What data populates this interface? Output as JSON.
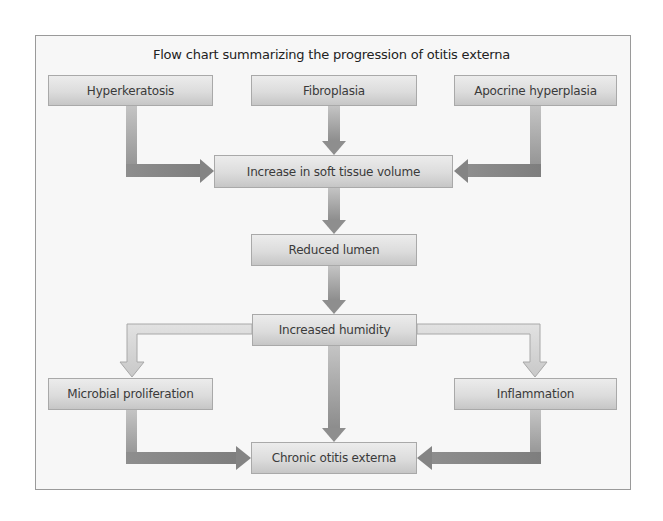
{
  "diagram": {
    "title": "Flow chart summarizing the progression of otitis externa",
    "nodes": {
      "hyperkeratosis": "Hyperkeratosis",
      "fibroplasia": "Fibroplasia",
      "apocrine": "Apocrine hyperplasia",
      "soft_tissue": "Increase in soft tissue volume",
      "reduced_lumen": "Reduced lumen",
      "humidity": "Increased humidity",
      "microbial": "Microbial proliferation",
      "inflammation": "Inflammation",
      "chronic": "Chronic otitis externa"
    },
    "edges": [
      {
        "from": "Hyperkeratosis",
        "to": "Increase in soft tissue volume"
      },
      {
        "from": "Fibroplasia",
        "to": "Increase in soft tissue volume"
      },
      {
        "from": "Apocrine hyperplasia",
        "to": "Increase in soft tissue volume"
      },
      {
        "from": "Increase in soft tissue volume",
        "to": "Reduced lumen"
      },
      {
        "from": "Reduced lumen",
        "to": "Increased humidity"
      },
      {
        "from": "Increased humidity",
        "to": "Microbial proliferation"
      },
      {
        "from": "Increased humidity",
        "to": "Inflammation"
      },
      {
        "from": "Increased humidity",
        "to": "Chronic otitis externa"
      },
      {
        "from": "Microbial proliferation",
        "to": "Chronic otitis externa"
      },
      {
        "from": "Inflammation",
        "to": "Chronic otitis externa"
      }
    ],
    "colors": {
      "arrow_dark": "#8a8a8a",
      "arrow_light": "#cfcfcf",
      "box_top": "#ececec",
      "box_bottom": "#c6c6c6",
      "frame_bg": "#f7f7f7"
    }
  }
}
